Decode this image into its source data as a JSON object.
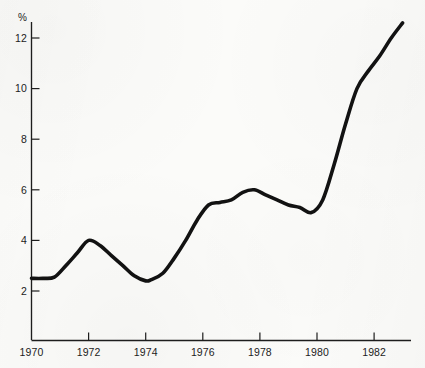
{
  "chart_data": {
    "type": "line",
    "title": "",
    "subtitle": "",
    "xlabel": "",
    "ylabel": "%",
    "y_unit_label": "%",
    "xlim": [
      1970,
      1983.2
    ],
    "ylim": [
      0.9,
      13.2
    ],
    "yticks": [
      2,
      4,
      6,
      8,
      10,
      12
    ],
    "ytick_labels": [
      "2",
      "4",
      "6",
      "8",
      "10",
      "12"
    ],
    "xticks": [
      1970,
      1972,
      1974,
      1976,
      1978,
      1980,
      1982
    ],
    "xtick_labels": [
      "1970",
      "1972",
      "1974",
      "1976",
      "1978",
      "1980",
      "1982"
    ],
    "grid": false,
    "legend": false,
    "legend_position": "none",
    "line_color": "#121212",
    "background_color": "#fbfbf9",
    "axis_color": "#1d1d1d",
    "series": [
      {
        "name": "",
        "x": [
          1970.0,
          1970.4,
          1970.8,
          1971.2,
          1971.6,
          1972.0,
          1972.4,
          1972.8,
          1973.2,
          1973.6,
          1974.0,
          1974.2,
          1974.6,
          1975.0,
          1975.4,
          1975.8,
          1976.2,
          1976.6,
          1977.0,
          1977.4,
          1977.8,
          1978.2,
          1978.6,
          1979.0,
          1979.4,
          1979.8,
          1980.2,
          1980.6,
          1981.0,
          1981.4,
          1981.8,
          1982.2,
          1982.6,
          1983.0
        ],
        "values": [
          2.5,
          2.5,
          2.55,
          3.0,
          3.5,
          4.0,
          3.8,
          3.4,
          3.0,
          2.6,
          2.4,
          2.45,
          2.7,
          3.3,
          4.0,
          4.8,
          5.4,
          5.5,
          5.6,
          5.9,
          6.0,
          5.8,
          5.6,
          5.4,
          5.3,
          5.1,
          5.6,
          7.0,
          8.6,
          10.0,
          10.7,
          11.3,
          12.0,
          12.6
        ]
      }
    ],
    "annotations": []
  }
}
